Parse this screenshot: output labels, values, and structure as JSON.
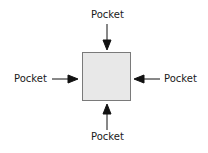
{
  "diagram": {
    "center_box": {
      "fill": "#e8e8e8",
      "border": "#7a7a7a"
    },
    "labels": {
      "top": "Pocket",
      "left": "Pocket",
      "right": "Pocket",
      "bottom": "Pocket"
    },
    "arrow_color": "#111111"
  }
}
